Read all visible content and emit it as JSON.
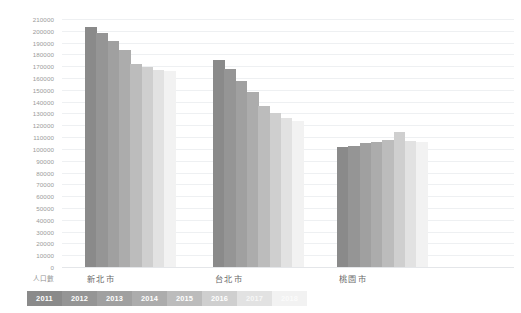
{
  "chart_data": {
    "type": "bar",
    "title": "",
    "xlabel": "",
    "ylabel": "人口數",
    "ylim": [
      0,
      210000
    ],
    "ytick_step": 10000,
    "grid": true,
    "legend_position": "bottom-left",
    "categories": [
      "新北市",
      "台北市",
      "桃園市"
    ],
    "yticks": [
      "210000",
      "200000",
      "190000",
      "180000",
      "170000",
      "160000",
      "150000",
      "140000",
      "130000",
      "120000",
      "110000",
      "100000",
      "90000",
      "80000",
      "70000",
      "60000",
      "50000",
      "40000",
      "30000",
      "20000",
      "10000",
      "0"
    ],
    "series": [
      {
        "name": "2011",
        "color": "#8a8a8a",
        "values": [
          203000,
          175500,
          101500
        ]
      },
      {
        "name": "2012",
        "color": "#959595",
        "values": [
          198000,
          168000,
          102500
        ]
      },
      {
        "name": "2013",
        "color": "#a0a0a0",
        "values": [
          191000,
          157500,
          105000
        ]
      },
      {
        "name": "2014",
        "color": "#acacac",
        "values": [
          183500,
          148500,
          105500
        ]
      },
      {
        "name": "2015",
        "color": "#bcbcbc",
        "values": [
          171500,
          136500,
          107500
        ]
      },
      {
        "name": "2016",
        "color": "#cfcfcf",
        "values": [
          169500,
          130500,
          114500
        ]
      },
      {
        "name": "2017",
        "color": "#e2e2e2",
        "values": [
          167000,
          126000,
          107000
        ]
      },
      {
        "name": "2018",
        "color": "#f2f2f2",
        "values": [
          166000,
          123500,
          106000
        ]
      }
    ]
  },
  "legend": {
    "items": [
      {
        "label": "2011",
        "color": "#8a8a8a",
        "text_color": "#ffffff"
      },
      {
        "label": "2012",
        "color": "#959595",
        "text_color": "#ffffff"
      },
      {
        "label": "2013",
        "color": "#a0a0a0",
        "text_color": "#ffffff"
      },
      {
        "label": "2014",
        "color": "#acacac",
        "text_color": "#ffffff"
      },
      {
        "label": "2015",
        "color": "#bcbcbc",
        "text_color": "#ffffff"
      },
      {
        "label": "2016",
        "color": "#cfcfcf",
        "text_color": "#ffffff"
      },
      {
        "label": "2017",
        "color": "#e2e2e2",
        "text_color": "#f7f7f7"
      },
      {
        "label": "2018",
        "color": "#f2f2f2",
        "text_color": "#fbfbfb"
      }
    ]
  }
}
